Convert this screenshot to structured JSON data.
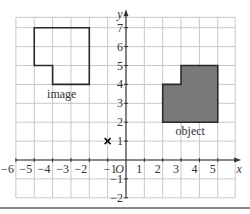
{
  "chart_data": {
    "type": "diagram",
    "title": "",
    "xlabel": "x",
    "ylabel": "y",
    "origin_label": "O",
    "xlim": [
      -6,
      5
    ],
    "ylim": [
      -2,
      7
    ],
    "x_ticks": [
      "-6",
      "-5",
      "-4",
      "-3",
      "-2",
      "-1",
      "1",
      "2",
      "3",
      "4",
      "5"
    ],
    "y_ticks": [
      "7",
      "6",
      "5",
      "4",
      "3",
      "2",
      "1",
      "-1",
      "-2"
    ],
    "grid": true,
    "shapes": [
      {
        "name": "image",
        "label": "image",
        "filled": false,
        "vertices": [
          [
            -5,
            7
          ],
          [
            -2,
            7
          ],
          [
            -2,
            4
          ],
          [
            -4,
            4
          ],
          [
            -4,
            5
          ],
          [
            -5,
            5
          ]
        ]
      },
      {
        "name": "object",
        "label": "object",
        "filled": true,
        "fill": "#7a7a7a",
        "vertices": [
          [
            3,
            5
          ],
          [
            5,
            5
          ],
          [
            5,
            2
          ],
          [
            2,
            2
          ],
          [
            2,
            4
          ],
          [
            3,
            4
          ]
        ]
      }
    ],
    "points": [
      {
        "name": "centre-of-enlargement",
        "marker": "x",
        "x": -1,
        "y": 1
      }
    ]
  },
  "labels": {
    "x_axis": "x",
    "y_axis": "y",
    "origin": "O",
    "image": "image",
    "object": "object"
  },
  "colors": {
    "grid": "#c8c8c8",
    "axis": "#333333",
    "outline": "#2a2a2a",
    "object_fill": "#7a7a7a"
  }
}
